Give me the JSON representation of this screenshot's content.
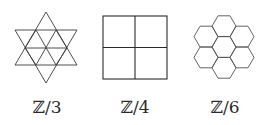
{
  "figures": [
    {
      "name": "triangular-tiling",
      "label": "ℤ/3",
      "shape": "hexagram-of-triangles"
    },
    {
      "name": "square-tiling",
      "label": "ℤ/4",
      "shape": "2x2-square-grid"
    },
    {
      "name": "hexagonal-tiling",
      "label": "ℤ/6",
      "shape": "seven-hexagon-cluster"
    }
  ],
  "colors": {
    "stroke": "#3a3a3a",
    "background": "#ffffff"
  }
}
